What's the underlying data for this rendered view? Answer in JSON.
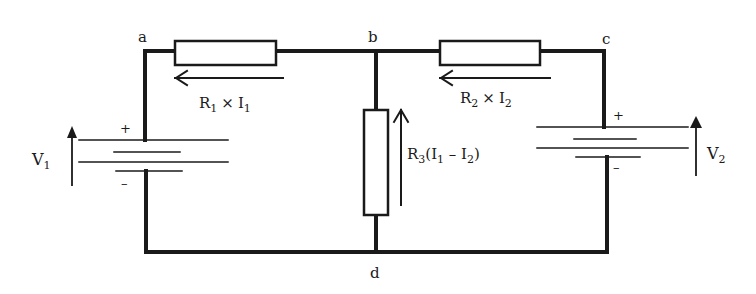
{
  "diagram": {
    "type": "circuit",
    "nodes": {
      "a": "a",
      "b": "b",
      "c": "c",
      "d": "d"
    },
    "sources": [
      {
        "id": "V1",
        "label": "V",
        "sub": "1",
        "plus": "+",
        "minus": "–"
      },
      {
        "id": "V2",
        "label": "V",
        "sub": "2",
        "plus": "+",
        "minus": "–"
      }
    ],
    "resistors": [
      {
        "id": "R1",
        "drop_label": {
          "r": "R",
          "r_sub": "1",
          "times": "×",
          "i": "I",
          "i_sub": "1"
        }
      },
      {
        "id": "R2",
        "drop_label": {
          "r": "R",
          "r_sub": "2",
          "times": "×",
          "i": "I",
          "i_sub": "2"
        }
      },
      {
        "id": "R3",
        "drop_label": {
          "r": "R",
          "r_sub": "3",
          "open": "(I",
          "i1_sub": "1",
          "minus": " – I",
          "i2_sub": "2",
          "close": ")"
        }
      }
    ],
    "colors": {
      "wire": "#1a1a1a",
      "background": "#ffffff"
    }
  }
}
